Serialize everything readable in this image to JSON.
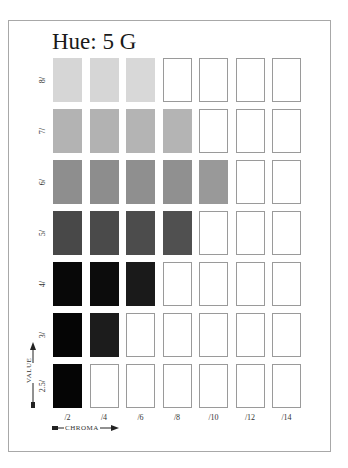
{
  "title": "Hue: 5 G",
  "axes": {
    "value_label": "VALUE",
    "chroma_label": "CHROMA"
  },
  "columns": [
    "/2",
    "/4",
    "/6",
    "/8",
    "/10",
    "/12",
    "/14"
  ],
  "rows": [
    {
      "label": "8/",
      "filled": 3,
      "colors": [
        "#d6d6d6",
        "#d6d6d6",
        "#d8d8d8"
      ]
    },
    {
      "label": "7/",
      "filled": 4,
      "colors": [
        "#b3b3b3",
        "#b2b2b2",
        "#b4b4b4",
        "#b4b4b4"
      ]
    },
    {
      "label": "6/",
      "filled": 5,
      "colors": [
        "#8e8e8e",
        "#8d8d8d",
        "#8f8f8f",
        "#909090",
        "#999999"
      ]
    },
    {
      "label": "5/",
      "filled": 4,
      "colors": [
        "#484848",
        "#4a4a4a",
        "#4c4c4c",
        "#505050"
      ]
    },
    {
      "label": "4/",
      "filled": 3,
      "colors": [
        "#080808",
        "#0c0c0c",
        "#1a1a1a"
      ]
    },
    {
      "label": "3/",
      "filled": 2,
      "colors": [
        "#050505",
        "#1c1c1c"
      ]
    },
    {
      "label": "2.5/",
      "filled": 1,
      "colors": [
        "#050505"
      ]
    }
  ],
  "colors": {
    "frame_border": "#a8a8a8",
    "empty_swatch_border": "#9a9a9a",
    "text": "#1a1a1a"
  }
}
